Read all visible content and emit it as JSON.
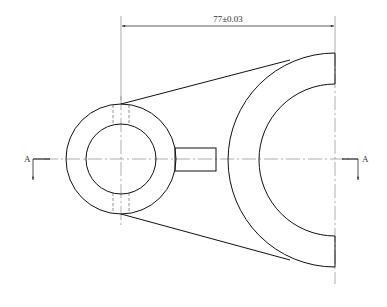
{
  "drawing": {
    "type": "technical-drawing",
    "view": "front-view",
    "dimension_label": "77±0.03",
    "section_label_left": "A",
    "section_label_right": "A",
    "colors": {
      "line": "#111111",
      "centerline": "#777777",
      "background": "#ffffff"
    },
    "small_boss": {
      "cx": 121,
      "cy": 159,
      "outer_r": 55,
      "inner_r": 35
    },
    "large_arc": {
      "cx": 335,
      "cy": 160,
      "outer_r": 110,
      "inner_r": 77
    },
    "lug": {
      "x": 175,
      "y": 148,
      "w": 41,
      "h": 23
    }
  }
}
